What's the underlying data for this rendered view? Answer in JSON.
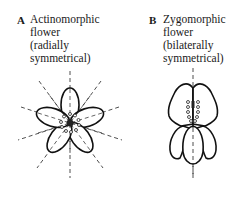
{
  "panels": [
    {
      "letter": "A",
      "title_lines": [
        "Actinomorphic",
        "flower",
        "(radially",
        "symmetrical)"
      ]
    },
    {
      "letter": "B",
      "title_lines": [
        "Zygomorphic",
        "flower",
        "(bilaterally",
        "symmetrical)"
      ]
    }
  ]
}
